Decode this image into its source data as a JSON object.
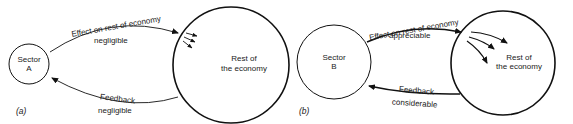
{
  "panels": [
    {
      "id": "a",
      "panel_label": "(a)",
      "sector": {
        "line1": "Sector",
        "line2": "A"
      },
      "rest": {
        "line1": "Rest of",
        "line2": "the economy"
      },
      "effect": {
        "title": "Effect on rest of economy",
        "magnitude": "negligible"
      },
      "feedback": {
        "title": "Feedback",
        "magnitude": "negligible"
      }
    },
    {
      "id": "b",
      "panel_label": "(b)",
      "sector": {
        "line1": "Sector",
        "line2": "B"
      },
      "rest": {
        "line1": "Rest of",
        "line2": "the economy"
      },
      "effect": {
        "title": "Effect on rest of economy",
        "magnitude": "appreciable"
      },
      "feedback": {
        "title": "Feedback",
        "magnitude": "considerable"
      }
    }
  ],
  "colors": {
    "stroke": "#111111",
    "text": "#222222",
    "background": "#ffffff"
  }
}
